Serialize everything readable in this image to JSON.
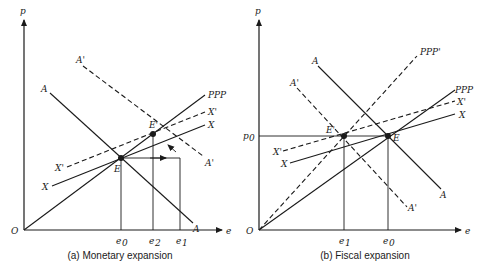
{
  "panel_a": {
    "caption": "(a) Monetary expansion",
    "y_axis_label": "p",
    "x_axis_label": "e",
    "origin_label": "O",
    "curves": {
      "ppp": "PPP",
      "x_prime": "X'",
      "x": "X",
      "a": "A",
      "a_prime": "A'"
    },
    "points": {
      "e": "E",
      "e_prime": "E'"
    },
    "ticks": {
      "e0": "e",
      "e0_sub": "0",
      "e2": "e",
      "e2_sub": "2",
      "e1": "e",
      "e1_sub": "1"
    }
  },
  "panel_b": {
    "caption": "(b) Fiscal expansion",
    "y_axis_label": "p",
    "x_axis_label": "e",
    "origin_label": "O",
    "p0_label": "p",
    "p0_sub": "0",
    "curves": {
      "ppp": "PPP",
      "ppp_prime": "PPP'",
      "x_prime": "X'",
      "x": "X",
      "a": "A",
      "a_prime": "A'"
    },
    "points": {
      "e": "E",
      "e_prime": "E'"
    },
    "ticks": {
      "e1": "e",
      "e1_sub": "1",
      "e0": "e",
      "e0_sub": "0"
    }
  }
}
